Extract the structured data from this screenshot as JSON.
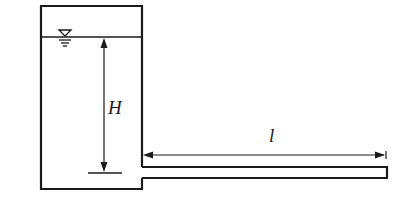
{
  "diagram": {
    "type": "tank-with-horizontal-pipe",
    "labels": {
      "head": "H",
      "pipe_length": "l"
    },
    "colors": {
      "stroke": "#1a1a1a",
      "background": "#ffffff"
    }
  }
}
